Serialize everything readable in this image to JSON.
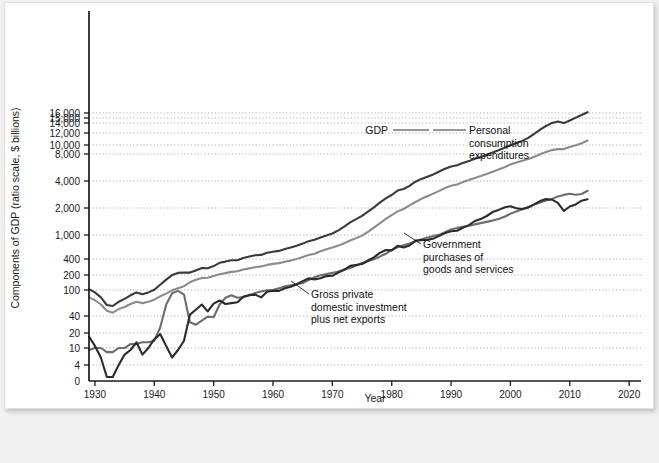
{
  "chart_data": {
    "type": "line",
    "title": "",
    "xlabel": "Year",
    "ylabel": "Components of GDP (ratio scale, $ billions)",
    "scale": "log",
    "grid": true,
    "legend_position": "inline-annotations",
    "xlim": [
      1929,
      2022
    ],
    "ylim": [
      0,
      17000
    ],
    "xticks": [
      "1930",
      "1940",
      "1950",
      "1960",
      "1970",
      "1980",
      "1990",
      "2000",
      "2010",
      "2020"
    ],
    "xtick_values": [
      1930,
      1940,
      1950,
      1960,
      1970,
      1980,
      1990,
      2000,
      2010,
      2020
    ],
    "yticks": [
      "0",
      "4",
      "10",
      "20",
      "40",
      "100",
      "200",
      "400",
      "1,000",
      "2,000",
      "4,000",
      "8,000",
      "10,000",
      "12,000",
      "14,000",
      "15,000",
      "16,000"
    ],
    "ytick_values": [
      0,
      4,
      10,
      20,
      40,
      100,
      200,
      400,
      1000,
      2000,
      4000,
      8000,
      10000,
      12000,
      14000,
      15000,
      16000
    ],
    "colors": {
      "gdp": "#3a3a3a",
      "personal_consumption": "#8c8c8c",
      "government": "#6e6e6e",
      "investment": "#2b2b2b",
      "grid": "#9a9a9a",
      "axis": "#1b1b1b",
      "card_background": "#ffffff",
      "page_background": "#f1f1f1"
    },
    "annotations": [
      {
        "id": "gdp",
        "text": "GDP"
      },
      {
        "id": "personal_consumption",
        "lines": [
          "Personal",
          "consumption",
          "expenditures"
        ]
      },
      {
        "id": "government",
        "lines": [
          "Government",
          "purchases of",
          "goods and services"
        ]
      },
      {
        "id": "investment",
        "lines": [
          "Gross private",
          "domestic investment",
          "plus net exports"
        ]
      }
    ],
    "series": [
      {
        "name": "GDP",
        "color": "#3a3a3a",
        "x": [
          1929,
          1930,
          1931,
          1932,
          1933,
          1934,
          1935,
          1936,
          1937,
          1938,
          1939,
          1940,
          1941,
          1942,
          1943,
          1944,
          1945,
          1946,
          1947,
          1948,
          1949,
          1950,
          1951,
          1952,
          1953,
          1954,
          1955,
          1956,
          1957,
          1958,
          1959,
          1960,
          1961,
          1962,
          1963,
          1964,
          1965,
          1966,
          1967,
          1968,
          1969,
          1970,
          1971,
          1972,
          1973,
          1974,
          1975,
          1976,
          1977,
          1978,
          1979,
          1980,
          1981,
          1982,
          1983,
          1984,
          1985,
          1986,
          1987,
          1988,
          1989,
          1990,
          1991,
          1992,
          1993,
          1994,
          1995,
          1996,
          1997,
          1998,
          1999,
          2000,
          2001,
          2002,
          2003,
          2004,
          2005,
          2006,
          2007,
          2008,
          2009,
          2010,
          2011,
          2012,
          2013
        ],
        "values": [
          104,
          92,
          77,
          59,
          57,
          66,
          73,
          83,
          92,
          86,
          92,
          101,
          127,
          162,
          199,
          219,
          223,
          222,
          244,
          270,
          267,
          294,
          339,
          358,
          379,
          380,
          415,
          438,
          461,
          467,
          507,
          527,
          545,
          586,
          618,
          664,
          719,
          788,
          832,
          910,
          985,
          1038,
          1127,
          1238,
          1383,
          1500,
          1638,
          1825,
          2031,
          2295,
          2563,
          2790,
          3128,
          3255,
          3537,
          3933,
          4220,
          4463,
          4740,
          5104,
          5484,
          5803,
          5996,
          6338,
          6667,
          7085,
          7415,
          7839,
          8332,
          8794,
          9354,
          9952,
          10286,
          10642,
          11142,
          11853,
          12623,
          13377,
          14029,
          14292,
          13974,
          14499,
          15076,
          15585,
          16163
        ]
      },
      {
        "name": "Personal consumption expenditures",
        "color": "#8c8c8c",
        "x": [
          1929,
          1930,
          1931,
          1932,
          1933,
          1934,
          1935,
          1936,
          1937,
          1938,
          1939,
          1940,
          1941,
          1942,
          1943,
          1944,
          1945,
          1946,
          1947,
          1948,
          1949,
          1950,
          1951,
          1952,
          1953,
          1954,
          1955,
          1956,
          1957,
          1958,
          1959,
          1960,
          1961,
          1962,
          1963,
          1964,
          1965,
          1966,
          1967,
          1968,
          1969,
          1970,
          1971,
          1972,
          1973,
          1974,
          1975,
          1976,
          1977,
          1978,
          1979,
          1980,
          1981,
          1982,
          1983,
          1984,
          1985,
          1986,
          1987,
          1988,
          1989,
          1990,
          1991,
          1992,
          1993,
          1994,
          1995,
          1996,
          1997,
          1998,
          1999,
          2000,
          2001,
          2002,
          2003,
          2004,
          2005,
          2006,
          2007,
          2008,
          2009,
          2010,
          2011,
          2012,
          2013
        ],
        "values": [
          77,
          70,
          60,
          48,
          45,
          51,
          55,
          61,
          66,
          63,
          66,
          71,
          80,
          88,
          99,
          108,
          119,
          143,
          160,
          173,
          176,
          191,
          206,
          217,
          229,
          236,
          254,
          266,
          281,
          290,
          310,
          324,
          335,
          355,
          374,
          400,
          430,
          464,
          490,
          536,
          580,
          621,
          667,
          732,
          811,
          888,
          976,
          1084,
          1205,
          1348,
          1510,
          1663,
          1832,
          1951,
          2143,
          2334,
          2536,
          2708,
          2895,
          3105,
          3342,
          3532,
          3657,
          3889,
          4095,
          4327,
          4537,
          4799,
          5070,
          5369,
          5704,
          6127,
          6435,
          6740,
          7055,
          7451,
          7946,
          8420,
          8813,
          9032,
          9039,
          9538,
          9959,
          10271,
          10700
        ]
      },
      {
        "name": "Government purchases of goods and services",
        "color": "#6e6e6e",
        "x": [
          1929,
          1930,
          1931,
          1932,
          1933,
          1934,
          1935,
          1936,
          1937,
          1938,
          1939,
          1940,
          1941,
          1942,
          1943,
          1944,
          1945,
          1946,
          1947,
          1948,
          1949,
          1950,
          1951,
          1952,
          1953,
          1954,
          1955,
          1956,
          1957,
          1958,
          1959,
          1960,
          1961,
          1962,
          1963,
          1964,
          1965,
          1966,
          1967,
          1968,
          1969,
          1970,
          1971,
          1972,
          1973,
          1974,
          1975,
          1976,
          1977,
          1978,
          1979,
          1980,
          1981,
          1982,
          1983,
          1984,
          1985,
          1986,
          1987,
          1988,
          1989,
          1990,
          1991,
          1992,
          1993,
          1994,
          1995,
          1996,
          1997,
          1998,
          1999,
          2000,
          2001,
          2002,
          2003,
          2004,
          2005,
          2006,
          2007,
          2008,
          2009,
          2010,
          2011,
          2012,
          2013
        ],
        "values": [
          9,
          10,
          10,
          8,
          8,
          10,
          10,
          12,
          12,
          13,
          13,
          14,
          25,
          60,
          89,
          97,
          85,
          31,
          28,
          33,
          39,
          38,
          60,
          76,
          83,
          76,
          78,
          82,
          90,
          95,
          99,
          100,
          108,
          118,
          124,
          130,
          138,
          158,
          180,
          198,
          208,
          219,
          234,
          254,
          270,
          302,
          336,
          362,
          395,
          438,
          487,
          566,
          628,
          675,
          720,
          784,
          852,
          912,
          966,
          1008,
          1071,
          1154,
          1201,
          1234,
          1271,
          1312,
          1356,
          1398,
          1446,
          1507,
          1601,
          1722,
          1831,
          1938,
          2050,
          2180,
          2300,
          2418,
          2528,
          2687,
          2797,
          2887,
          2817,
          2865,
          3114
        ]
      },
      {
        "name": "Gross private domestic investment plus net exports",
        "color": "#2b2b2b",
        "x": [
          1929,
          1930,
          1931,
          1932,
          1933,
          1934,
          1935,
          1936,
          1937,
          1938,
          1939,
          1940,
          1941,
          1942,
          1943,
          1944,
          1945,
          1946,
          1947,
          1948,
          1949,
          1950,
          1951,
          1952,
          1953,
          1954,
          1955,
          1956,
          1957,
          1958,
          1959,
          1960,
          1961,
          1962,
          1963,
          1964,
          1965,
          1966,
          1967,
          1968,
          1969,
          1970,
          1971,
          1972,
          1973,
          1974,
          1975,
          1976,
          1977,
          1978,
          1979,
          1980,
          1981,
          1982,
          1983,
          1984,
          1985,
          1986,
          1987,
          1988,
          1989,
          1990,
          1991,
          1992,
          1993,
          1994,
          1995,
          1996,
          1997,
          1998,
          1999,
          2000,
          2001,
          2002,
          2003,
          2004,
          2005,
          2006,
          2007,
          2008,
          2009,
          2010,
          2011,
          2012,
          2013
        ],
        "values": [
          17,
          11,
          6,
          1,
          1,
          4,
          7,
          9,
          13,
          7,
          10,
          15,
          19,
          11,
          6,
          9,
          14,
          42,
          50,
          60,
          47,
          62,
          69,
          61,
          63,
          65,
          79,
          84,
          85,
          77,
          94,
          98,
          97,
          108,
          116,
          131,
          151,
          171,
          163,
          172,
          190,
          193,
          222,
          249,
          297,
          308,
          322,
          375,
          427,
          505,
          563,
          555,
          663,
          620,
          670,
          808,
          822,
          831,
          873,
          967,
          1049,
          1099,
          1114,
          1204,
          1288,
          1432,
          1505,
          1627,
          1802,
          1904,
          2028,
          2095,
          1987,
          1949,
          2021,
          2193,
          2389,
          2513,
          2477,
          2278,
          1859,
          2080,
          2194,
          2415,
          2510
        ]
      }
    ]
  }
}
